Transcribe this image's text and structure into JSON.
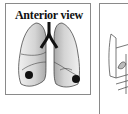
{
  "figure": {
    "left_panel": {
      "title": "Anterior view",
      "lungs": [
        "right-lung",
        "left-lung"
      ],
      "nodules": 2
    },
    "right_panel": {
      "content": "partial illustration"
    },
    "colors": {
      "border": "#8a8a8a",
      "lung_fill_light": "#e8e8e8",
      "lung_fill_dark": "#a8a8a8",
      "trachea": "#111111",
      "nodule": "#111111"
    }
  }
}
